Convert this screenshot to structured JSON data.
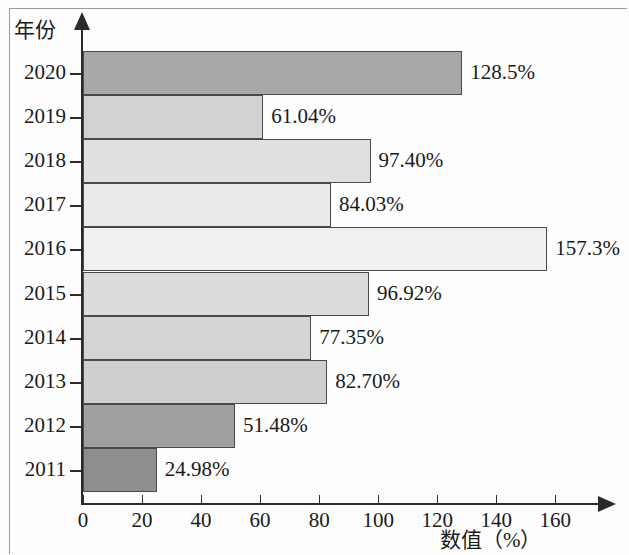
{
  "chart_data": {
    "type": "bar",
    "orientation": "horizontal",
    "title": "",
    "xlabel": "数值（%）",
    "ylabel": "年份",
    "categories": [
      "2020",
      "2019",
      "2018",
      "2017",
      "2016",
      "2015",
      "2014",
      "2013",
      "2012",
      "2011"
    ],
    "values": [
      128.5,
      61.04,
      97.4,
      84.03,
      157.3,
      96.92,
      77.35,
      82.7,
      51.48,
      24.98
    ],
    "value_labels": [
      "128.5%",
      "61.04%",
      "97.40%",
      "84.03%",
      "157.3%",
      "96.92%",
      "77.35%",
      "82.70%",
      "51.48%",
      "24.98%"
    ],
    "bar_colors": [
      "#a8a8a8",
      "#d2d2d2",
      "#e0e0e0",
      "#eaeaea",
      "#f0f0f0",
      "#dcdcdc",
      "#d4d4d4",
      "#cfcfcf",
      "#a0a0a0",
      "#8e8e8e"
    ],
    "xticks": [
      0,
      20,
      40,
      60,
      80,
      100,
      120,
      140,
      160
    ],
    "xtick_labels": [
      "0",
      "20",
      "40",
      "60",
      "80",
      "100",
      "120",
      "140",
      "160"
    ],
    "xlim": [
      0,
      176
    ],
    "grid": false,
    "legend": null,
    "bar_edge_color": "#4a4a4a",
    "axis_color": "#2b2b2b"
  }
}
